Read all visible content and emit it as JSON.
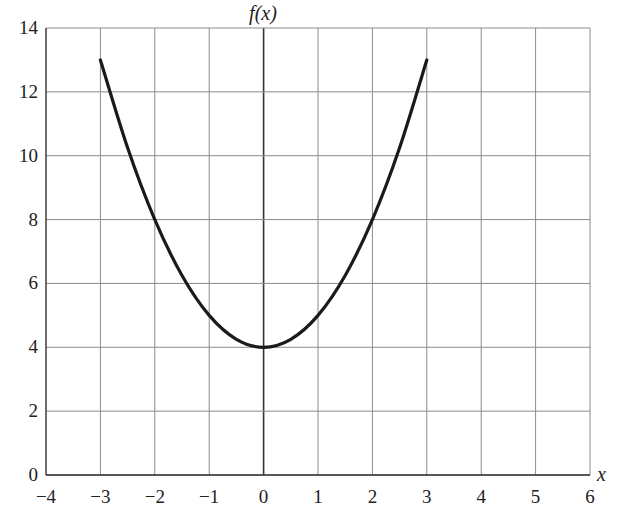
{
  "chart_data": {
    "type": "line",
    "title": "",
    "xlabel": "x",
    "ylabel": "f(x)",
    "xlim": [
      -4,
      6
    ],
    "ylim": [
      0,
      14
    ],
    "grid": true,
    "x_ticks": [
      "−4",
      "−3",
      "−2",
      "−1",
      "0",
      "1",
      "2",
      "3",
      "4",
      "5",
      "6"
    ],
    "y_ticks": [
      "0",
      "2",
      "4",
      "6",
      "8",
      "10",
      "12",
      "14"
    ],
    "series": [
      {
        "name": "f(x)",
        "x": [
          -3,
          -2.5,
          -2,
          -1.5,
          -1,
          -0.5,
          0,
          0.5,
          1,
          1.5,
          2,
          2.5,
          3
        ],
        "y": [
          13,
          10.25,
          8,
          6.25,
          5,
          4.25,
          4,
          4.25,
          5,
          6.25,
          8,
          10.25,
          13
        ]
      }
    ],
    "legend": "none"
  },
  "colors": {
    "curve": "#1a1a1a",
    "grid": "#8a8a8a",
    "axis": "#333333"
  }
}
